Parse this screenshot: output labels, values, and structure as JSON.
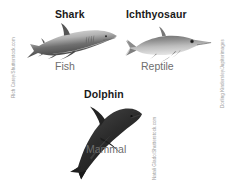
{
  "canvas": {
    "width": 227,
    "height": 185,
    "background": "#ffffff"
  },
  "colors": {
    "heading_text": "#1a1a1a",
    "class_label_text": "#6e6e6e",
    "credit_text": "#9a9a9a",
    "shark_body": "#8d8d8d",
    "ichthyosaur_body": "#9b9b9b",
    "dolphin_body": "#2b2b2b"
  },
  "figures": [
    {
      "id": "shark",
      "heading": "Shark",
      "class_label": "Fish",
      "icon_name": "shark-silhouette"
    },
    {
      "id": "ichthyosaur",
      "heading": "Ichthyosaur",
      "class_label": "Reptile",
      "icon_name": "ichthyosaur-silhouette"
    },
    {
      "id": "dolphin",
      "heading": "Dolphin",
      "class_label": "Mammal",
      "icon_name": "dolphin-silhouette"
    }
  ],
  "credits": {
    "left": "Rich Carey/Shutterstock.com",
    "right": "Dorling Kindersley/Jupiterimages",
    "middle": "Natali Glado/Shutterstock.com"
  }
}
